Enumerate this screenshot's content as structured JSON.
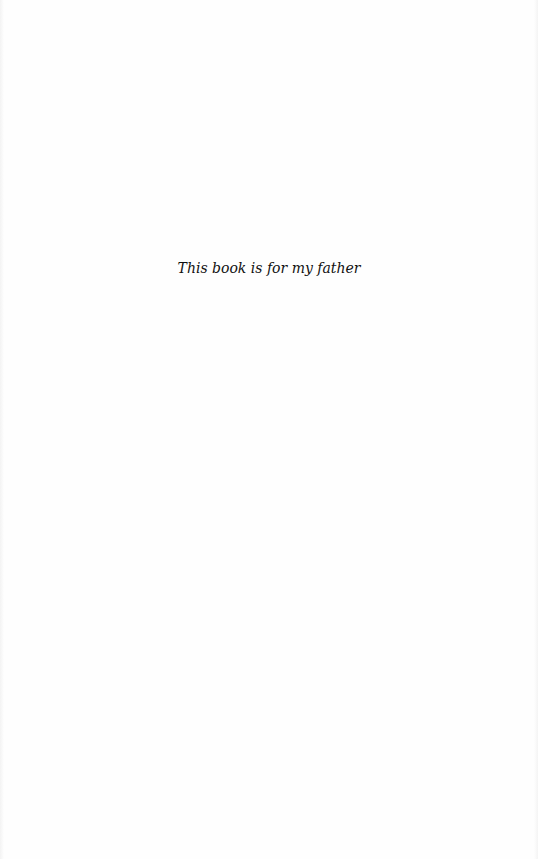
{
  "page": {
    "type": "dedication",
    "dedication_text": "This book is for my father"
  }
}
